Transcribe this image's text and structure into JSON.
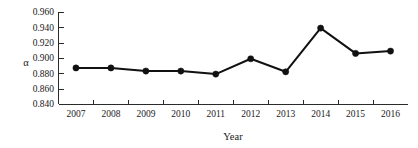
{
  "chart_data": {
    "type": "line",
    "title": "",
    "xlabel": "Year",
    "ylabel": "α",
    "categories": [
      "2007",
      "2008",
      "2009",
      "2010",
      "2011",
      "2012",
      "2013",
      "2014",
      "2015",
      "2016"
    ],
    "values": [
      0.887,
      0.887,
      0.883,
      0.883,
      0.879,
      0.899,
      0.882,
      0.939,
      0.906,
      0.909
    ],
    "series": [
      {
        "name": "α",
        "values": [
          0.887,
          0.887,
          0.883,
          0.883,
          0.879,
          0.899,
          0.882,
          0.939,
          0.906,
          0.909
        ]
      }
    ],
    "ylim": [
      0.84,
      0.96
    ],
    "ytick_labels": [
      "0.840",
      "0.860",
      "0.880",
      "0.900",
      "0.920",
      "0.940",
      "0.960"
    ],
    "ytick_values": [
      0.84,
      0.86,
      0.88,
      0.9,
      0.92,
      0.94,
      0.96
    ],
    "xtick_labels": [
      "2007",
      "2008",
      "2009",
      "2010",
      "2011",
      "2012",
      "2013",
      "2014",
      "2015",
      "2016"
    ],
    "grid": false,
    "legend": "none",
    "marker": "filled-circle",
    "line_color": "#111111",
    "marker_color": "#111111",
    "axis_color": "#2b2b2b",
    "background": "#ffffff"
  },
  "axes": {
    "y_axis_title": "α",
    "x_axis_title": "Year"
  }
}
